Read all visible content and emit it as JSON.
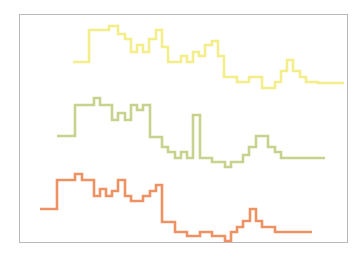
{
  "figure": {
    "title": "",
    "background_color": "#ffffff",
    "frame_color": "#b9b9bd",
    "frame": {
      "x": 19,
      "y": 14,
      "width": 329,
      "height": 229
    }
  },
  "chart_data": {
    "type": "line",
    "subtype": "step-post",
    "title": "",
    "xlabel": "",
    "ylabel": "",
    "grid": false,
    "legend": "none",
    "axis_ticks": "none",
    "xlim": [
      0,
      364
    ],
    "ylim": [
      258,
      0
    ],
    "note": "Three vertically offset step (staircase) traces drawn in pixel coordinates; y increases downward.",
    "series": [
      {
        "name": "top-series",
        "color": "#f3ed8a",
        "line_width": 2.6,
        "x": [
          73,
          89,
          89,
          109,
          109,
          118,
          118,
          125,
          125,
          131,
          131,
          137,
          137,
          143,
          143,
          149,
          149,
          156,
          156,
          162,
          162,
          168,
          168,
          181,
          181,
          187,
          187,
          193,
          193,
          199,
          199,
          205,
          205,
          212,
          212,
          218,
          218,
          224,
          224,
          237,
          237,
          249,
          249,
          262,
          262,
          275,
          275,
          281,
          281,
          287,
          287,
          293,
          293,
          300,
          300,
          306,
          306,
          312,
          312,
          318,
          318,
          331,
          331,
          344
        ],
        "y": [
          62,
          62,
          30,
          30,
          26,
          26,
          34,
          34,
          39,
          39,
          52,
          52,
          45,
          45,
          52,
          52,
          39,
          39,
          30,
          30,
          47,
          47,
          62,
          62,
          56,
          56,
          62,
          62,
          52,
          52,
          56,
          56,
          45,
          45,
          41,
          41,
          56,
          56,
          77,
          77,
          82,
          82,
          77,
          77,
          88,
          88,
          82,
          82,
          71,
          71,
          60,
          60,
          71,
          71,
          77,
          77,
          82,
          82,
          82,
          82,
          83,
          83,
          83,
          83
        ],
        "values_compact": [
          62,
          30,
          26,
          34,
          39,
          52,
          45,
          52,
          39,
          30,
          47,
          62,
          56,
          62,
          52,
          56,
          45,
          41,
          56,
          77,
          82,
          77,
          88,
          82,
          71,
          60,
          71,
          77,
          82,
          83
        ]
      },
      {
        "name": "middle-series",
        "color": "#c8d28c",
        "line_width": 2.6,
        "x": [
          57,
          75,
          75,
          94,
          94,
          100,
          100,
          112,
          112,
          118,
          118,
          125,
          125,
          131,
          131,
          137,
          137,
          143,
          143,
          150,
          150,
          162,
          162,
          168,
          168,
          175,
          175,
          181,
          181,
          187,
          187,
          193,
          193,
          200,
          200,
          212,
          212,
          225,
          225,
          231,
          231,
          243,
          243,
          249,
          249,
          256,
          256,
          268,
          268,
          275,
          275,
          281,
          281,
          293,
          293,
          300,
          300,
          312,
          312,
          325
        ],
        "y": [
          136,
          136,
          105,
          105,
          98,
          98,
          105,
          105,
          120,
          120,
          113,
          113,
          120,
          120,
          105,
          105,
          110,
          110,
          105,
          105,
          137,
          137,
          147,
          147,
          152,
          152,
          158,
          158,
          152,
          152,
          158,
          158,
          115,
          115,
          158,
          158,
          162,
          162,
          167,
          167,
          162,
          162,
          155,
          155,
          147,
          147,
          136,
          136,
          147,
          147,
          152,
          152,
          158,
          158,
          158,
          158,
          158,
          158,
          158,
          158
        ],
        "values_compact": [
          136,
          105,
          98,
          105,
          120,
          113,
          120,
          105,
          110,
          105,
          137,
          147,
          152,
          158,
          152,
          158,
          115,
          158,
          162,
          167,
          162,
          155,
          147,
          136,
          147,
          152,
          158
        ]
      },
      {
        "name": "bottom-series",
        "color": "#ee9263",
        "line_width": 2.6,
        "x": [
          40,
          57,
          57,
          75,
          75,
          82,
          82,
          94,
          94,
          100,
          100,
          106,
          106,
          112,
          112,
          118,
          118,
          125,
          125,
          131,
          131,
          143,
          143,
          150,
          150,
          156,
          156,
          162,
          162,
          175,
          175,
          187,
          187,
          200,
          200,
          212,
          212,
          225,
          225,
          231,
          231,
          237,
          237,
          243,
          243,
          250,
          250,
          256,
          256,
          262,
          262,
          275,
          275,
          281,
          281,
          287,
          287,
          300,
          300,
          312
        ],
        "y": [
          209,
          209,
          180,
          180,
          174,
          174,
          180,
          180,
          196,
          196,
          189,
          189,
          196,
          196,
          191,
          191,
          180,
          180,
          196,
          196,
          201,
          201,
          196,
          196,
          191,
          191,
          185,
          185,
          222,
          222,
          232,
          232,
          236,
          236,
          232,
          232,
          236,
          236,
          241,
          241,
          232,
          232,
          227,
          227,
          221,
          221,
          209,
          209,
          221,
          221,
          227,
          227,
          232,
          232,
          232,
          232,
          232,
          232,
          232,
          232
        ],
        "values_compact": [
          209,
          180,
          174,
          180,
          196,
          189,
          196,
          191,
          180,
          196,
          201,
          196,
          191,
          185,
          222,
          232,
          236,
          232,
          236,
          241,
          232,
          227,
          221,
          209,
          221,
          227,
          232
        ]
      }
    ]
  }
}
